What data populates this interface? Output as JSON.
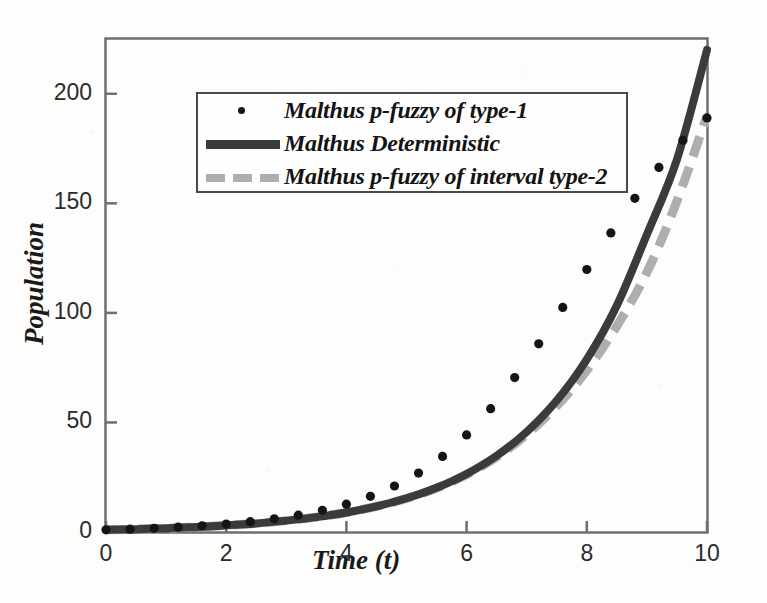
{
  "chart_data": {
    "type": "line",
    "title": "",
    "xlabel": "Time (t)",
    "ylabel": "Population",
    "xlim": [
      0,
      10
    ],
    "ylim": [
      0,
      225
    ],
    "xticks": [
      0,
      2,
      4,
      6,
      8,
      10
    ],
    "yticks": [
      0,
      50,
      100,
      150,
      200
    ],
    "grid": false,
    "legend_position": "upper-left-inside",
    "series": [
      {
        "name": "Malthus p-fuzzy of type-1",
        "style": "dots",
        "color": "#151515",
        "x": [
          0.0,
          0.4,
          0.8,
          1.2,
          1.6,
          2.0,
          2.4,
          2.8,
          3.2,
          3.6,
          4.0,
          4.4,
          4.8,
          5.2,
          5.6,
          6.0,
          6.4,
          6.8,
          7.2,
          7.6,
          8.0,
          8.4,
          8.8,
          9.2,
          9.6,
          10.0
        ],
        "y": [
          1.0,
          1.3,
          1.7,
          2.2,
          2.8,
          3.6,
          4.7,
          6.0,
          7.7,
          9.9,
          12.7,
          16.3,
          21.0,
          26.9,
          34.5,
          44.3,
          56.3,
          70.5,
          85.9,
          102.5,
          119.8,
          136.5,
          152.3,
          166.4,
          178.8,
          189.0
        ]
      },
      {
        "name": "Malthus Deterministic",
        "style": "solid",
        "color": "#3b3b3b",
        "x": [
          0.0,
          0.5,
          1.0,
          1.5,
          2.0,
          2.5,
          3.0,
          3.5,
          4.0,
          4.5,
          5.0,
          5.5,
          6.0,
          6.5,
          7.0,
          7.5,
          8.0,
          8.5,
          9.0,
          9.5,
          10.0
        ],
        "y": [
          1.0,
          1.3,
          1.7,
          2.3,
          3.0,
          3.9,
          5.2,
          6.8,
          8.9,
          11.7,
          15.4,
          20.2,
          26.5,
          34.8,
          45.7,
          60.0,
          78.8,
          103.4,
          135.8,
          170.0,
          220.0
        ]
      },
      {
        "name": "Malthus p-fuzzy of interval type-2",
        "style": "dashed",
        "color": "#aeaeae",
        "x": [
          0.0,
          0.5,
          1.0,
          1.5,
          2.0,
          2.5,
          3.0,
          3.5,
          4.0,
          4.5,
          5.0,
          5.5,
          6.0,
          6.5,
          7.0,
          7.5,
          8.0,
          8.5,
          9.0,
          9.5,
          10.0
        ],
        "y": [
          1.0,
          1.3,
          1.7,
          2.3,
          3.0,
          3.9,
          5.2,
          6.8,
          8.9,
          11.7,
          15.3,
          20.0,
          26.2,
          34.2,
          44.5,
          57.5,
          73.8,
          94.0,
          118.5,
          151.0,
          190.0
        ]
      }
    ]
  },
  "axes": {
    "x_tick_labels": [
      "0",
      "2",
      "4",
      "6",
      "8",
      "10"
    ],
    "y_tick_labels": [
      "0",
      "50",
      "100",
      "150",
      "200"
    ],
    "x_title": "Time (t)",
    "y_title": "Population"
  },
  "legend": {
    "entries": [
      {
        "label": "Malthus p-fuzzy of type-1",
        "key": "dot-marker"
      },
      {
        "label": "Malthus Deterministic",
        "key": "solid-line"
      },
      {
        "label": "Malthus p-fuzzy of interval type-2",
        "key": "dashed-line"
      }
    ]
  },
  "colors": {
    "deterministic": "#3b3b3b",
    "interval_type2": "#aeaeae",
    "type1_dots": "#151515",
    "axis": "#6e6e6e"
  }
}
